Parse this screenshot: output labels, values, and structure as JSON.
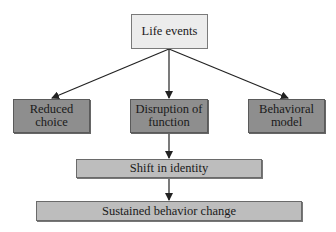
{
  "diagram": {
    "type": "flowchart",
    "nodes": {
      "root": {
        "label": "Life events"
      },
      "left": {
        "label": "Reduced\nchoice"
      },
      "center": {
        "label": "Disruption of\nfunction"
      },
      "right": {
        "label": "Behavioral\nmodel"
      },
      "identity": {
        "label": "Shift in identity"
      },
      "outcome": {
        "label": "Sustained behavior change"
      }
    },
    "edges": [
      {
        "from": "Life events",
        "to": "Reduced choice"
      },
      {
        "from": "Life events",
        "to": "Disruption of function"
      },
      {
        "from": "Life events",
        "to": "Behavioral model"
      },
      {
        "from": "Disruption of function",
        "to": "Shift in identity"
      },
      {
        "from": "Shift in identity",
        "to": "Sustained behavior change"
      }
    ],
    "colors": {
      "root_fill": "#ececec",
      "mid_row_fill": "#8e8e8e",
      "lower_fill": "#bdbdbd",
      "stroke": "#222222"
    }
  }
}
